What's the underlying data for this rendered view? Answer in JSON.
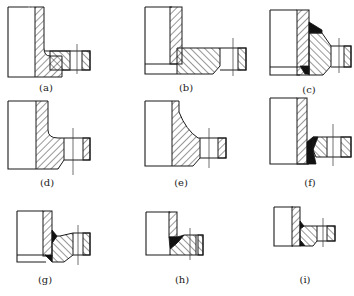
{
  "figure": {
    "colors": {
      "line": "#1a1a1a",
      "weld_fill": "#111111",
      "background": "#ffffff"
    },
    "panels": [
      {
        "id": "a",
        "label": "(a)",
        "type": "lap joint flange, fillet"
      },
      {
        "id": "b",
        "label": "(b)",
        "type": "slip-on flange with pipe"
      },
      {
        "id": "c",
        "label": "(c)",
        "type": "welded hub flange, double weld"
      },
      {
        "id": "d",
        "label": "(d)",
        "type": "integral flange with fillet"
      },
      {
        "id": "e",
        "label": "(e)",
        "type": "integral hubbed flange"
      },
      {
        "id": "f",
        "label": "(f)",
        "type": "ring flange, groove weld"
      },
      {
        "id": "g",
        "label": "(g)",
        "type": "hub flange, weld both sides"
      },
      {
        "id": "h",
        "label": "(h)",
        "type": "flange with round fillet weld"
      },
      {
        "id": "i",
        "label": "(i)",
        "type": "small hub flange, welded"
      }
    ]
  }
}
